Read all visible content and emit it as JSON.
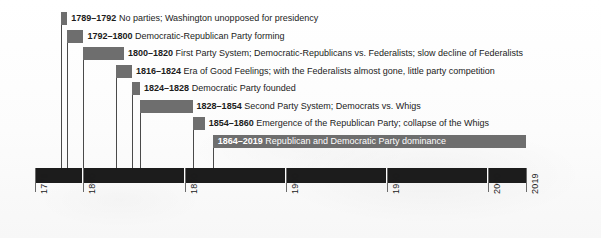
{
  "chart_data": {
    "type": "bar",
    "title": "",
    "subtitle": "",
    "xlabel": "",
    "ylabel": "",
    "orientation": "horizontal-timeline",
    "grid": false,
    "legend": "none",
    "xlim": [
      1776,
      2019
    ],
    "axis": {
      "ticks": [
        1776,
        1800,
        1850,
        1900,
        1950,
        2000,
        2019
      ],
      "tick_labels": [
        "1776",
        "1800",
        "1850",
        "1900",
        "1950",
        "2000",
        "2019"
      ],
      "label_rotation": -90,
      "bar_color": "#1c1c1c",
      "segment_breaks": [
        1800,
        1850,
        1900,
        1950,
        2000
      ]
    },
    "bar_color": "#6e6e6e",
    "eras": [
      {
        "start": 1789,
        "end": 1792,
        "years": "1789–1792",
        "description": "No parties; Washington unopposed for presidency",
        "label_position": "right"
      },
      {
        "start": 1792,
        "end": 1800,
        "years": "1792–1800",
        "description": "Democratic-Republican Party forming",
        "label_position": "right"
      },
      {
        "start": 1800,
        "end": 1820,
        "years": "1800–1820",
        "description": "First Party System; Democratic-Republicans vs. Federalists; slow decline of Federalists",
        "label_position": "right"
      },
      {
        "start": 1816,
        "end": 1824,
        "years": "1816–1824",
        "description": "Era of Good Feelings; with the Federalists almost gone, little party competition",
        "label_position": "right"
      },
      {
        "start": 1824,
        "end": 1828,
        "years": "1824–1828",
        "description": "Democratic Party founded",
        "label_position": "right"
      },
      {
        "start": 1828,
        "end": 1854,
        "years": "1828–1854",
        "description": "Second Party System; Democrats vs. Whigs",
        "label_position": "right"
      },
      {
        "start": 1854,
        "end": 1860,
        "years": "1854–1860",
        "description": "Emergence of the Republican Party; collapse of the Whigs",
        "label_position": "right"
      },
      {
        "start": 1864,
        "end": 2019,
        "years": "1864–2019",
        "description": "Republican and Democratic Party dominance",
        "label_position": "inside"
      }
    ]
  }
}
